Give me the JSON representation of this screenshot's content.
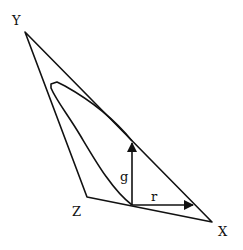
{
  "diagram": {
    "type": "chromaticity-triangle",
    "vertices": {
      "Y": {
        "label": "Y",
        "x": 25,
        "y": 32
      },
      "Z": {
        "label": "Z",
        "x": 87,
        "y": 197
      },
      "X": {
        "label": "X",
        "x": 212,
        "y": 222
      }
    },
    "vectors": {
      "g": {
        "label": "g"
      },
      "r": {
        "label": "r"
      }
    },
    "colors": {
      "stroke": "#111111",
      "background": "#ffffff"
    }
  }
}
